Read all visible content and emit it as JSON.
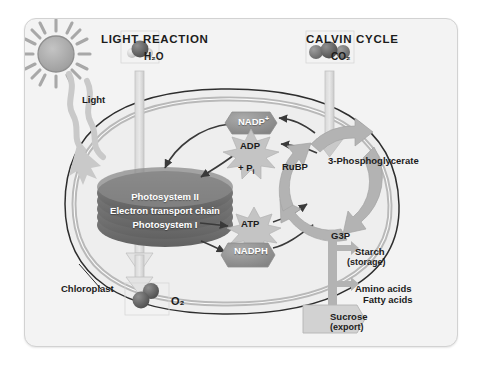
{
  "figure": {
    "kind": "photosynthesis-overview-diagram",
    "headings": {
      "light_reaction": "LIGHT REACTION",
      "calvin_cycle": "CALVIN CYCLE"
    },
    "inputs": {
      "light": "Light",
      "water": "H₂O",
      "carbon_dioxide": "CO₂"
    },
    "outputs": {
      "oxygen": "O₂",
      "sucrose": "Sucrose",
      "sucrose_note": "(export)",
      "starch": "Starch",
      "starch_note": "(storage)",
      "amino_acids": "Amino acids",
      "fatty_acids": "Fatty acids"
    },
    "organelle": {
      "label": "Chloroplast"
    },
    "thylakoid_stack": {
      "line1": "Photosystem II",
      "line2": "Electron transport chain",
      "line3": "Photosystem I"
    },
    "energy_carriers": {
      "nadp_plus": "NADP",
      "nadp_plus_charge": "+",
      "adp": "ADP",
      "phosphate": "+ P",
      "phosphate_sub": "i",
      "atp": "ATP",
      "nadph": "NADPH"
    },
    "calvin_intermediates": {
      "rubp": "RuBP",
      "three_pg": "3-Phosphoglycerate",
      "g3p": "G3P"
    },
    "colors": {
      "panel_bg": "#f3f3f3",
      "panel_border": "#d2d2d2",
      "stroma": "#eeeeee",
      "envelope": "#b9b9b9",
      "granum": "#7d7d7d",
      "granum_dark": "#5f5f5f",
      "cycle_arrow": "#b3b3b3",
      "flow_arrow": "#c9c9c9",
      "thin_arrow": "#3a3a3a",
      "burst": "#c2c2c2",
      "carrier_pill": "#9a9a9a",
      "sun": "#a8a8a8",
      "molecule_dark": "#5a5a5a",
      "molecule_light": "#d8d8d8",
      "text": "#1c1c1c",
      "text_on_dark": "#ffffff"
    }
  }
}
